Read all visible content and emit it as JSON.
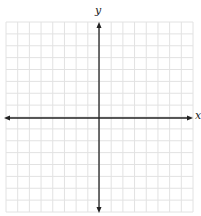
{
  "diagram": {
    "type": "coordinate-plane",
    "x_axis_label": "x",
    "y_axis_label": "y",
    "grid": {
      "columns": 16,
      "rows": 16,
      "left": 6,
      "top": 22,
      "right": 193,
      "bottom": 212,
      "line_color": "#e2e2e2"
    },
    "axes": {
      "origin_x": 99,
      "origin_y": 118,
      "color": "#222222",
      "x_arrow_left": 4,
      "x_arrow_right": 193,
      "y_arrow_top": 22,
      "y_arrow_bottom": 213
    }
  }
}
